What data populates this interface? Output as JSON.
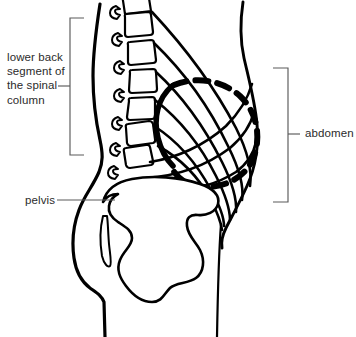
{
  "figure": {
    "width": 356,
    "height": 337,
    "background_color": "#ffffff",
    "line_color": "#000000",
    "leader_color": "#5a5a5a",
    "text_color": "#2b2b2b"
  },
  "labels": {
    "lower_back": {
      "text": "lower back\nsegment of\nthe spinal\ncolumn",
      "lines": [
        "lower back",
        "segment of",
        "the spinal",
        "column"
      ],
      "position": "left",
      "connector": "square-bracket"
    },
    "abdomen": {
      "text": "abdomen",
      "position": "right",
      "connector": "square-bracket"
    },
    "pelvis": {
      "text": "pelvis",
      "position": "left",
      "connector": "straight-leader-line"
    }
  },
  "anatomy": {
    "vertebrae_count": 7,
    "structures": [
      "back-contour",
      "abdomen-contour",
      "lumbar-vertebrae",
      "spinous-processes",
      "pelvis-bone",
      "sacrum-sliver",
      "abdominal-muscle-fibers",
      "dashed-organ-ring",
      "groin-line"
    ]
  }
}
